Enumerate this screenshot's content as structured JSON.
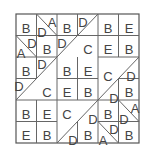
{
  "puzzle": {
    "rows": 6,
    "cols": 6,
    "colors": {
      "line": "#666666",
      "text": "#444444",
      "background": "#ffffff"
    },
    "labels": [
      {
        "id": "r0c0",
        "text": "B",
        "x": 26,
        "y": 30
      },
      {
        "id": "r0c1-lower",
        "text": "D",
        "x": 42,
        "y": 34
      },
      {
        "id": "r0c1-upper",
        "text": "A",
        "x": 52,
        "y": 24
      },
      {
        "id": "r0c2",
        "text": "B",
        "x": 67,
        "y": 30
      },
      {
        "id": "r0c3-upper",
        "text": "D",
        "x": 83,
        "y": 24
      },
      {
        "id": "r0c4",
        "text": "B",
        "x": 108,
        "y": 30
      },
      {
        "id": "r0c5",
        "text": "E",
        "x": 129,
        "y": 30
      },
      {
        "id": "r1c0-upper",
        "text": "D",
        "x": 32,
        "y": 45
      },
      {
        "id": "r1c0-lower",
        "text": "A",
        "x": 21,
        "y": 55
      },
      {
        "id": "r1c1",
        "text": "B",
        "x": 47,
        "y": 51
      },
      {
        "id": "r1c2-upper",
        "text": "D",
        "x": 62,
        "y": 45
      },
      {
        "id": "block-a",
        "text": "C",
        "x": 88,
        "y": 51
      },
      {
        "id": "r1c4",
        "text": "E",
        "x": 108,
        "y": 51
      },
      {
        "id": "r1c5",
        "text": "B",
        "x": 129,
        "y": 51
      },
      {
        "id": "r2c0",
        "text": "B",
        "x": 26,
        "y": 73
      },
      {
        "id": "r2c1-upper",
        "text": "D",
        "x": 42,
        "y": 66
      },
      {
        "id": "r2c2",
        "text": "B",
        "x": 67,
        "y": 73
      },
      {
        "id": "r2c3",
        "text": "E",
        "x": 88,
        "y": 73
      },
      {
        "id": "block-b",
        "text": "C",
        "x": 108,
        "y": 78
      },
      {
        "id": "r2c5-lower",
        "text": "D",
        "x": 131,
        "y": 78
      },
      {
        "id": "r3c0-upper",
        "text": "D",
        "x": 19,
        "y": 88
      },
      {
        "id": "block-c",
        "text": "C",
        "x": 47,
        "y": 94
      },
      {
        "id": "r3c2",
        "text": "E",
        "x": 67,
        "y": 94
      },
      {
        "id": "r3c3",
        "text": "B",
        "x": 88,
        "y": 94
      },
      {
        "id": "r3c4-lower",
        "text": "D",
        "x": 114,
        "y": 100
      },
      {
        "id": "r3c5",
        "text": "B",
        "x": 129,
        "y": 94
      },
      {
        "id": "r4c0",
        "text": "B",
        "x": 26,
        "y": 116
      },
      {
        "id": "r4c1",
        "text": "E",
        "x": 47,
        "y": 116
      },
      {
        "id": "block-d",
        "text": "C",
        "x": 67,
        "y": 116
      },
      {
        "id": "r4c3-lower",
        "text": "D",
        "x": 93,
        "y": 121
      },
      {
        "id": "r4c4",
        "text": "B",
        "x": 108,
        "y": 116
      },
      {
        "id": "r4c5-upper",
        "text": "A",
        "x": 135,
        "y": 110
      },
      {
        "id": "r4c5-lower",
        "text": "D",
        "x": 124,
        "y": 121
      },
      {
        "id": "r5c0",
        "text": "E",
        "x": 26,
        "y": 137
      },
      {
        "id": "r5c1",
        "text": "B",
        "x": 47,
        "y": 137
      },
      {
        "id": "r5c2-lower",
        "text": "D",
        "x": 73,
        "y": 142
      },
      {
        "id": "r5c3",
        "text": "B",
        "x": 88,
        "y": 137
      },
      {
        "id": "r5c4-upper",
        "text": "D",
        "x": 114,
        "y": 131
      },
      {
        "id": "r5c4-lower",
        "text": "A",
        "x": 103,
        "y": 142
      },
      {
        "id": "r5c5",
        "text": "B",
        "x": 129,
        "y": 137
      }
    ]
  }
}
